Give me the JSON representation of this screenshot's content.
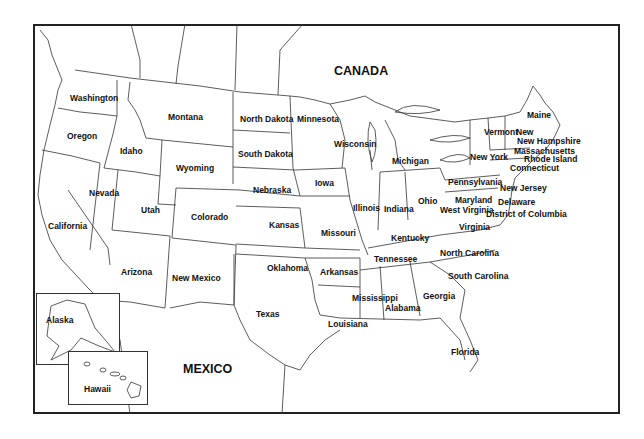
{
  "map": {
    "countries": [
      {
        "name": "CANADA",
        "x": 334,
        "y": 65
      },
      {
        "name": "MEXICO",
        "x": 183,
        "y": 363
      }
    ],
    "states": [
      {
        "name": "Washington",
        "x": 70,
        "y": 94
      },
      {
        "name": "Oregon",
        "x": 67,
        "y": 132
      },
      {
        "name": "Idaho",
        "x": 120,
        "y": 147
      },
      {
        "name": "Montana",
        "x": 168,
        "y": 113
      },
      {
        "name": "Wyoming",
        "x": 176,
        "y": 164
      },
      {
        "name": "North Dakota",
        "x": 240,
        "y": 115
      },
      {
        "name": "South Dakota",
        "x": 238,
        "y": 150
      },
      {
        "name": "Minnesota",
        "x": 297,
        "y": 115
      },
      {
        "name": "Wisconsin",
        "x": 334,
        "y": 140
      },
      {
        "name": "Michigan",
        "x": 392,
        "y": 157
      },
      {
        "name": "Nevada",
        "x": 89,
        "y": 189
      },
      {
        "name": "California",
        "x": 48,
        "y": 222
      },
      {
        "name": "Utah",
        "x": 141,
        "y": 206
      },
      {
        "name": "Colorado",
        "x": 191,
        "y": 213
      },
      {
        "name": "Nebraska",
        "x": 253,
        "y": 186
      },
      {
        "name": "Iowa",
        "x": 315,
        "y": 179
      },
      {
        "name": "Kansas",
        "x": 269,
        "y": 221
      },
      {
        "name": "Missouri",
        "x": 321,
        "y": 229
      },
      {
        "name": "Illinois",
        "x": 353,
        "y": 204
      },
      {
        "name": "Indiana",
        "x": 384,
        "y": 205
      },
      {
        "name": "Ohio",
        "x": 418,
        "y": 197
      },
      {
        "name": "Arizona",
        "x": 121,
        "y": 268
      },
      {
        "name": "New Mexico",
        "x": 172,
        "y": 274
      },
      {
        "name": "Oklahoma",
        "x": 267,
        "y": 264
      },
      {
        "name": "Arkansas",
        "x": 320,
        "y": 268
      },
      {
        "name": "Tennessee",
        "x": 374,
        "y": 255
      },
      {
        "name": "Kentucky",
        "x": 391,
        "y": 234
      },
      {
        "name": "Texas",
        "x": 256,
        "y": 310
      },
      {
        "name": "Louisiana",
        "x": 328,
        "y": 320
      },
      {
        "name": "Mississippi",
        "x": 352,
        "y": 294
      },
      {
        "name": "Alabama",
        "x": 385,
        "y": 304
      },
      {
        "name": "Georgia",
        "x": 423,
        "y": 292
      },
      {
        "name": "Florida",
        "x": 451,
        "y": 348
      },
      {
        "name": "South Carolina",
        "x": 448,
        "y": 272
      },
      {
        "name": "North Carolina",
        "x": 440,
        "y": 249
      },
      {
        "name": "Virginia",
        "x": 459,
        "y": 223
      },
      {
        "name": "West Virginia",
        "x": 440,
        "y": 206
      },
      {
        "name": "Maryland",
        "x": 455,
        "y": 196
      },
      {
        "name": "Delaware",
        "x": 498,
        "y": 198
      },
      {
        "name": "District of Columbia",
        "x": 486,
        "y": 210
      },
      {
        "name": "New Jersey",
        "x": 500,
        "y": 184
      },
      {
        "name": "Pennsylvania",
        "x": 448,
        "y": 178
      },
      {
        "name": "New York",
        "x": 470,
        "y": 153
      },
      {
        "name": "Connecticut",
        "x": 510,
        "y": 164
      },
      {
        "name": "Rhode Island",
        "x": 524,
        "y": 155
      },
      {
        "name": "Massachusetts",
        "x": 514,
        "y": 147
      },
      {
        "name": "New Hampshire",
        "x": 517,
        "y": 137
      },
      {
        "name": "Vermont",
        "x": 484,
        "y": 128
      },
      {
        "name": "New",
        "x": 516,
        "y": 128
      },
      {
        "name": "Maine",
        "x": 527,
        "y": 111
      }
    ],
    "insets": [
      {
        "name": "Alaska",
        "x": 46,
        "y": 316
      },
      {
        "name": "Hawaii",
        "x": 84,
        "y": 385
      }
    ]
  }
}
